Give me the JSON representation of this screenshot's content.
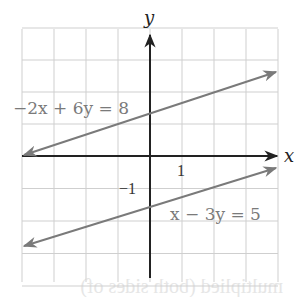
{
  "chart_data": {
    "type": "line",
    "title": "",
    "xlabel": "x",
    "ylabel": "y",
    "xlim": [
      -4,
      4
    ],
    "ylim": [
      -4,
      4
    ],
    "grid": true,
    "tick_labels": {
      "x": [
        "1"
      ],
      "y": [
        "−1"
      ]
    },
    "series": [
      {
        "name": "−2x + 6y = 8",
        "equation": "y = x/3 + 4/3",
        "x": [
          -4,
          4
        ],
        "y": [
          0,
          2.67
        ],
        "color": "#7a7a7a"
      },
      {
        "name": "x − 3y = 5",
        "equation": "y = x/3 − 5/3",
        "x": [
          -4,
          4
        ],
        "y": [
          -3,
          -0.33
        ],
        "color": "#7a7a7a"
      }
    ]
  },
  "labels": {
    "x_axis": "x",
    "y_axis": "y",
    "tick_x": "1",
    "tick_y": "−1",
    "eq1": "−2x + 6y = 8",
    "eq2": "x − 3y = 5",
    "bleed_through": "multiplied (both sides of)"
  },
  "colors": {
    "axis": "#222222",
    "grid": "#cfcfcf",
    "line": "#7a7a7a"
  }
}
